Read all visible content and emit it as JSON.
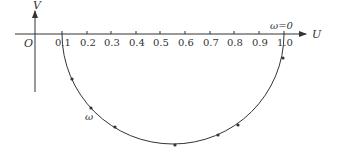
{
  "diagram": {
    "type": "nyquist-semicircle",
    "axes": {
      "x_label": "U",
      "y_label": "V",
      "origin_label": "O",
      "x_ticks": [
        "0.1",
        "0.2",
        "0.3",
        "0.4",
        "0.5",
        "0.6",
        "0.7",
        "0.8",
        "0.9",
        "1.0"
      ]
    },
    "curve": {
      "start_label": "ω=0",
      "direction_label": "ω",
      "start_u": 1.0,
      "end_u": 0.1,
      "shape": "lower semicircle from U=1.0 to U=0.1"
    },
    "colors": {
      "line": "#333333",
      "background": "#ffffff"
    }
  }
}
